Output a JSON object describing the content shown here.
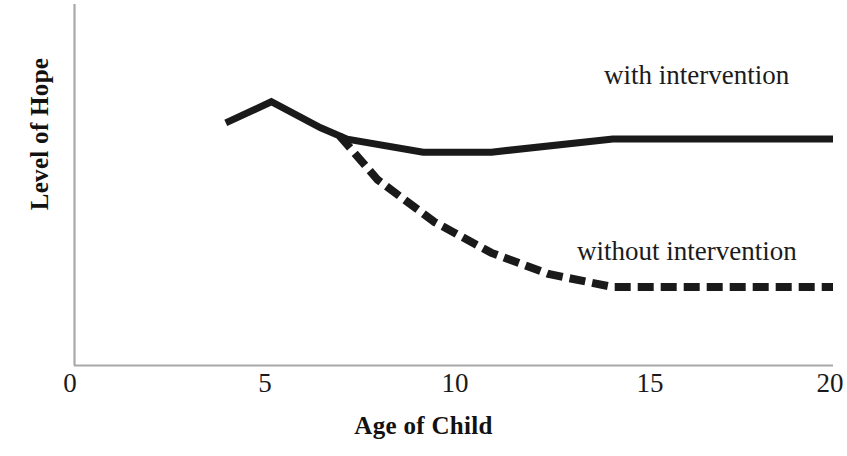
{
  "chart_data": {
    "type": "line",
    "title": "",
    "subtitle": "",
    "xlabel": "Age of Child",
    "ylabel": "Level of Hope",
    "xlim": [
      0,
      20
    ],
    "ylim": [
      0,
      10
    ],
    "xticks": [
      0,
      5,
      10,
      15,
      20
    ],
    "xtick_labels": [
      "0",
      "5",
      "10",
      "15",
      "20"
    ],
    "yticks": [],
    "ytick_labels": [],
    "grid": false,
    "legend": "inline annotations at end of each series",
    "axis_color": "#a8a8a8",
    "series_color": "#1a1a1a",
    "series": [
      {
        "name": "with intervention",
        "style": "solid",
        "label_position": "upper-right",
        "x": [
          4.0,
          5.2,
          6.5,
          7.2,
          9.2,
          11.0,
          14.2,
          20.0
        ],
        "y": [
          7.45,
          8.1,
          7.3,
          6.95,
          6.55,
          6.55,
          6.95,
          6.95
        ]
      },
      {
        "name": "without intervention",
        "style": "dashed",
        "label_position": "lower-right",
        "x": [
          7.0,
          8.0,
          9.5,
          11.0,
          12.5,
          14.2,
          20.0
        ],
        "y": [
          7.05,
          5.7,
          4.4,
          3.45,
          2.8,
          2.4,
          2.4
        ]
      }
    ],
    "annotations": [
      {
        "text": "with intervention",
        "series": "with intervention"
      },
      {
        "text": "without intervention",
        "series": "without intervention"
      }
    ]
  },
  "axis": {
    "x_tick_0": "0",
    "x_tick_5": "5",
    "x_tick_10": "10",
    "x_tick_15": "15",
    "x_tick_20": "20",
    "x_title": "Age of Child",
    "y_title": "Level of Hope"
  },
  "labels": {
    "with_intervention": "with intervention",
    "without_intervention": "without intervention"
  }
}
